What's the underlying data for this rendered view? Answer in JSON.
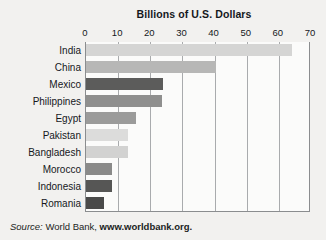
{
  "chart_data": {
    "type": "bar",
    "orientation": "horizontal",
    "title": "Billions of U.S. Dollars",
    "xlabel": "",
    "ylabel": "",
    "xlim": [
      0,
      70
    ],
    "xticks": [
      0,
      10,
      20,
      30,
      40,
      50,
      60,
      70
    ],
    "xtick_labels": [
      "0",
      "10",
      "20",
      "30",
      "40",
      "50",
      "60",
      "70"
    ],
    "grid": true,
    "grid_axis": "x",
    "legend": false,
    "categories": [
      "India",
      "China",
      "Mexico",
      "Philippines",
      "Egypt",
      "Pakistan",
      "Bangladesh",
      "Morocco",
      "Indonesia",
      "Romania"
    ],
    "values": [
      64,
      40.5,
      24,
      23.5,
      15.5,
      13,
      13,
      8,
      8,
      5.5
    ],
    "bar_colors": [
      "#d5d5d4",
      "#b7b7b6",
      "#5c5c5b",
      "#8f8f8e",
      "#9b9b9a",
      "#dcdcdb",
      "#d2d2d1",
      "#8a8a89",
      "#565655",
      "#4a4a49"
    ]
  },
  "source": {
    "label": "Source:",
    "publisher": "World Bank,",
    "url": "www.worldbank.org."
  },
  "colors": {
    "background": "#f2f1ef",
    "plot_background": "#fbfbfa",
    "gridline": "#a9abad",
    "axis": "#8b8d8f",
    "text": "#15181c"
  }
}
